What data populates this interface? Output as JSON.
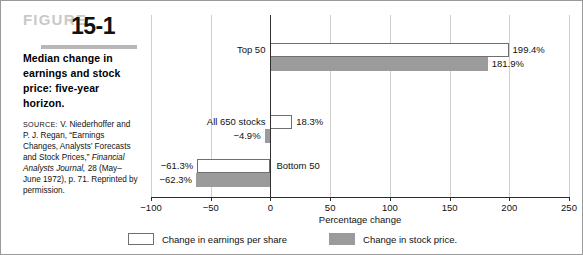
{
  "figure": {
    "word": "FIGURE",
    "number": "15-1",
    "caption": "Median change in earnings and stock price: five-year horizon.",
    "source_label": "SOURCE:",
    "source_text_1": " V. Niederhoffer and P. J. Regan, “Earnings Changes, Analysts’ Forecasts and Stock Prices,” ",
    "source_italic": "Financial Analysts Journal,",
    "source_text_2": " 28 (May–June 1972), p. 71. Reprinted by permission."
  },
  "legend": {
    "items": [
      {
        "label": "Change in earnings per share",
        "swatch": "earnings",
        "color": "#ffffff"
      },
      {
        "label": "Change in stock price.",
        "swatch": "stock",
        "color": "#9b9b9b"
      }
    ]
  },
  "chart_data": {
    "type": "bar",
    "orientation": "horizontal",
    "title": "Median change in earnings and stock price: five-year horizon.",
    "xlabel": "Percentage change",
    "ylabel": "",
    "xlim": [
      -100,
      250
    ],
    "xticks": [
      -100,
      -50,
      0,
      50,
      100,
      150,
      200,
      250
    ],
    "xtick_labels": [
      "−100",
      "−50",
      "0",
      "50",
      "100",
      "150",
      "200",
      "250"
    ],
    "grid": true,
    "legend_position": "bottom-center",
    "categories": [
      "Top 50",
      "All 650 stocks",
      "Bottom 50"
    ],
    "series": [
      {
        "name": "Change in earnings per share",
        "color": "#ffffff",
        "values": [
          199.4,
          18.3,
          -61.3
        ],
        "labels": [
          "199.4%",
          "18.3%",
          "−61.3%"
        ]
      },
      {
        "name": "Change in stock price.",
        "color": "#9b9b9b",
        "values": [
          181.9,
          -4.9,
          -62.3
        ],
        "labels": [
          "181.9%",
          "−4.9%",
          "−62.3%"
        ]
      }
    ]
  }
}
